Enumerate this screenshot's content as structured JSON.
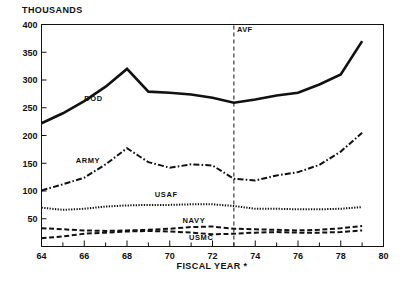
{
  "chart_data": {
    "type": "line",
    "title": "THOUSANDS",
    "xlabel": "FISCAL YEAR *",
    "ylabel": "THOUSANDS",
    "xlim": [
      64,
      80
    ],
    "ylim": [
      0,
      400
    ],
    "ytick_labels": [
      "50",
      "100",
      "150",
      "200",
      "250",
      "300",
      "350",
      "400"
    ],
    "ytick_values": [
      50,
      100,
      150,
      200,
      250,
      300,
      350,
      400
    ],
    "xtick_labels": [
      "64",
      "66",
      "68",
      "70",
      "72",
      "74",
      "76",
      "78",
      "80"
    ],
    "xtick_values": [
      64,
      66,
      68,
      70,
      72,
      74,
      76,
      78,
      80
    ],
    "xminor_values": [
      65,
      67,
      69,
      71,
      73,
      75,
      77,
      79
    ],
    "grid": false,
    "legend": "inline-labels",
    "x": [
      64,
      65,
      66,
      67,
      68,
      69,
      70,
      71,
      72,
      73,
      74,
      75,
      76,
      77,
      78,
      79
    ],
    "series": [
      {
        "name": "DOD",
        "style": "solid",
        "label": "DOD",
        "label_x": 66.0,
        "label_y": 268,
        "values": [
          222,
          240,
          262,
          288,
          320,
          279,
          277,
          274,
          268,
          259,
          265,
          272,
          277,
          292,
          310,
          370
        ]
      },
      {
        "name": "ARMY",
        "style": "dash-dot",
        "label": "ARMY",
        "label_x": 65.6,
        "label_y": 156,
        "values": [
          101,
          112,
          124,
          148,
          177,
          152,
          142,
          148,
          146,
          122,
          119,
          128,
          134,
          147,
          171,
          205
        ]
      },
      {
        "name": "USAF",
        "style": "dotted",
        "label": "USAF",
        "label_x": 69.3,
        "label_y": 95,
        "values": [
          70,
          66,
          68,
          72,
          74,
          75,
          75,
          76,
          76,
          73,
          68,
          68,
          67,
          67,
          68,
          71
        ]
      },
      {
        "name": "NAVY",
        "style": "dashed",
        "label": "NAVY",
        "label_x": 70.6,
        "label_y": 47,
        "values": [
          33,
          31,
          29,
          28,
          29,
          30,
          32,
          35,
          36,
          32,
          31,
          30,
          29,
          30,
          33,
          37
        ]
      },
      {
        "name": "USMC",
        "style": "dashed",
        "label": "USMC",
        "label_x": 70.9,
        "label_y": 18,
        "values": [
          15,
          18,
          23,
          25,
          27,
          28,
          27,
          25,
          22,
          23,
          25,
          26,
          25,
          25,
          26,
          29
        ]
      }
    ],
    "annotations": [
      {
        "name": "AVF",
        "label": "AVF",
        "type": "vertical-line",
        "x": 73,
        "label_y": 392
      }
    ]
  }
}
